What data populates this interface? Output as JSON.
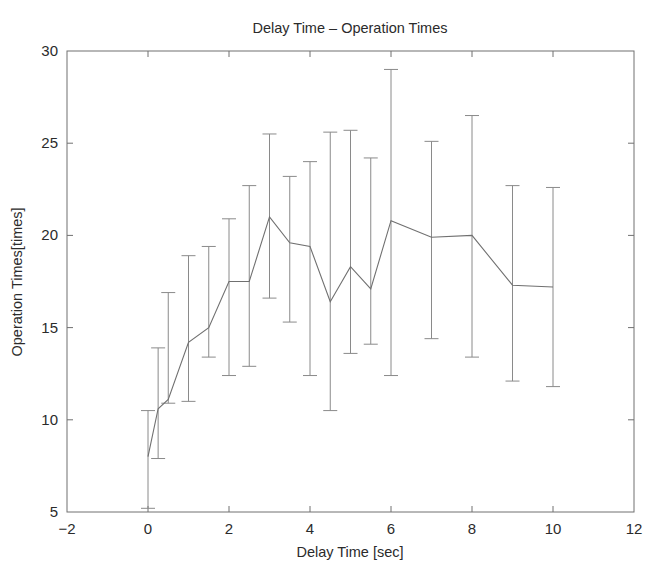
{
  "chart_data": {
    "type": "line",
    "title": "Delay Time – Operation Times",
    "xlabel": "Delay Time [sec]",
    "ylabel": "Operation Times[times]",
    "xlim": [
      -2,
      12
    ],
    "ylim": [
      5,
      30
    ],
    "xticks": [
      -2,
      0,
      2,
      4,
      6,
      8,
      10,
      12
    ],
    "xticklabels": [
      "−2",
      "0",
      "2",
      "4",
      "6",
      "8",
      "10",
      "12"
    ],
    "yticks": [
      5,
      10,
      15,
      20,
      25,
      30
    ],
    "yticklabels": [
      "5",
      "10",
      "15",
      "20",
      "25",
      "30"
    ],
    "grid": false,
    "legend": null,
    "errorbars": true,
    "series": [
      {
        "name": "Operation Times",
        "x": [
          0,
          0.25,
          0.5,
          1,
          1.5,
          2,
          2.5,
          3,
          3.5,
          4,
          4.5,
          5,
          5.5,
          6,
          7,
          8,
          9,
          10
        ],
        "values": [
          8.0,
          10.6,
          11.1,
          14.2,
          15.0,
          17.5,
          17.5,
          21.0,
          19.6,
          19.4,
          16.4,
          18.3,
          17.1,
          20.8,
          19.9,
          20.0,
          17.3,
          17.2
        ],
        "err_low": [
          5.2,
          7.9,
          10.9,
          11.0,
          13.4,
          12.4,
          12.9,
          16.6,
          15.3,
          12.4,
          10.5,
          13.6,
          14.1,
          12.4,
          14.4,
          13.4,
          12.1,
          11.8
        ],
        "err_high": [
          10.5,
          13.9,
          16.9,
          18.9,
          19.4,
          20.9,
          22.7,
          25.5,
          23.2,
          24.0,
          25.6,
          25.7,
          24.2,
          29.0,
          25.1,
          26.5,
          22.7,
          22.6
        ]
      }
    ]
  },
  "colors": {
    "line": "#707070",
    "errorbar": "#8a8a8a",
    "axis": "#707070",
    "text": "#2b2b2b",
    "background": "#ffffff"
  }
}
